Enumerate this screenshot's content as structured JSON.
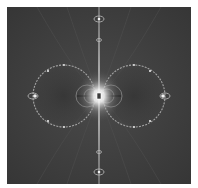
{
  "image": {
    "subject": "fractal-render",
    "description": "Grayscale fractal with two symmetric circular lobes, bright central point, and vertical axis line",
    "colors": {
      "background": "#3c3c3c",
      "glow": "#ffffff",
      "ring": "#a8a8a8",
      "page": "#ffffff"
    }
  }
}
